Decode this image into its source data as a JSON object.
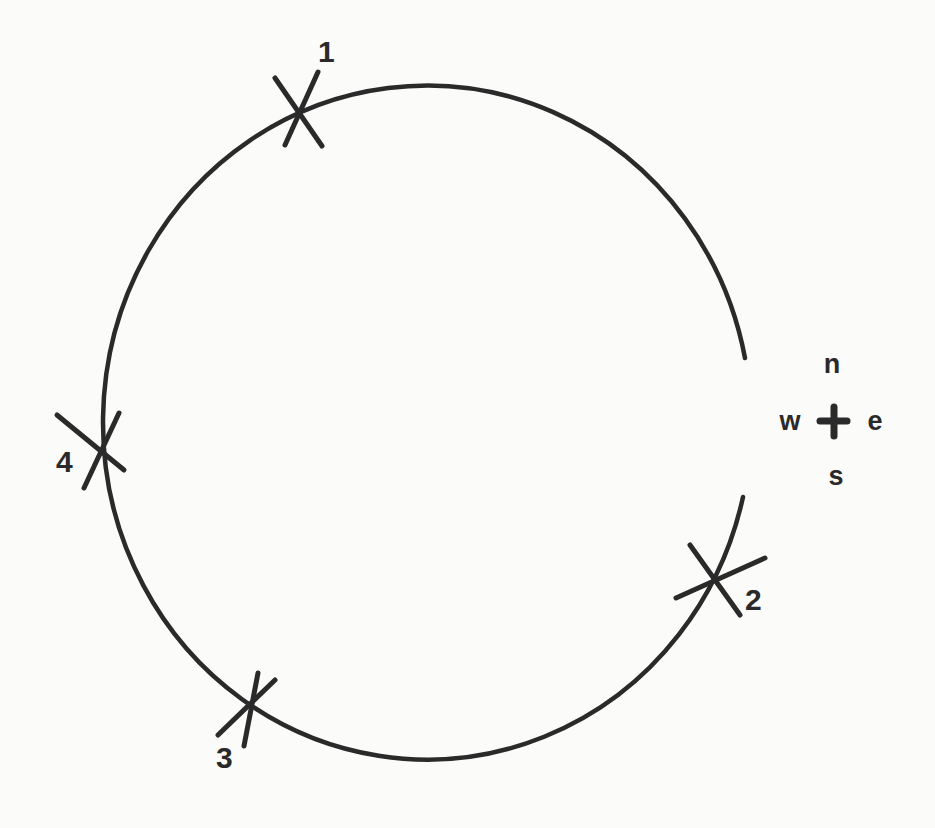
{
  "diagram": {
    "title": "",
    "orbit": {
      "shape": "ellipse",
      "center": [
        421,
        420
      ],
      "rx": 324,
      "ry": 337,
      "gap": "right side, between north-east and south-east (opening toward the compass)",
      "stroke_color": "#2a2a2a"
    },
    "marks": [
      {
        "label": "1",
        "x": 297,
        "y": 108
      },
      {
        "label": "2",
        "x": 713,
        "y": 578
      },
      {
        "label": "3",
        "x": 248,
        "y": 705
      },
      {
        "label": "4",
        "x": 97,
        "y": 450
      }
    ],
    "compass": {
      "n": "n",
      "s": "s",
      "e": "e",
      "w": "w",
      "symbol": "+"
    }
  }
}
